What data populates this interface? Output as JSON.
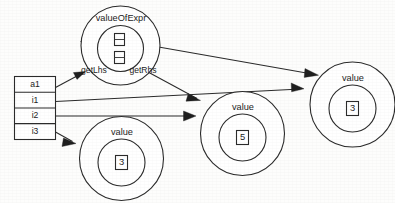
{
  "diagram": {
    "type": "object-diagram",
    "background_color": "#fdfdfc",
    "ink_color": "#2b2b2b"
  },
  "variable_table": {
    "name": "variable-table",
    "rows": [
      {
        "label": "a1"
      },
      {
        "label": "i1"
      },
      {
        "label": "i2"
      },
      {
        "label": "i3"
      }
    ]
  },
  "objects": [
    {
      "id": "valueOfExpr",
      "class_label": "valueOfExpr",
      "roles": [
        {
          "label": "getLhs"
        },
        {
          "label": "getRhs"
        }
      ],
      "slots": [
        {
          "label": ""
        },
        {
          "label": ""
        }
      ]
    },
    {
      "id": "value-top-right",
      "class_label": "value",
      "field_value": "3"
    },
    {
      "id": "value-middle",
      "class_label": "value",
      "field_value": "5"
    },
    {
      "id": "value-bottom-left",
      "class_label": "value",
      "field_value": "3"
    }
  ],
  "edges": [
    {
      "from": "a1",
      "to": "valueOfExpr"
    },
    {
      "from": "valueOfExpr.slot1",
      "to": "value-top-right"
    },
    {
      "from": "valueOfExpr.slot2",
      "to": "value-middle"
    },
    {
      "from": "i1",
      "to": "value-top-right"
    },
    {
      "from": "i2",
      "to": "value-middle"
    },
    {
      "from": "i3",
      "to": "value-bottom-left"
    }
  ]
}
